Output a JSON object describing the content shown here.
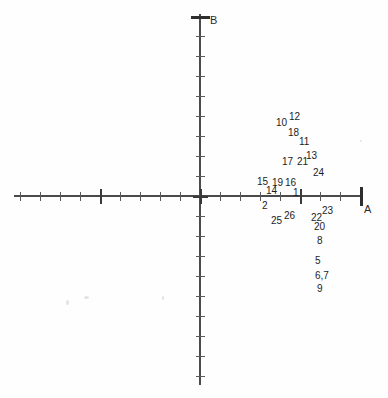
{
  "chart_data": {
    "type": "scatter",
    "title": "",
    "subtitle": "",
    "xlabel": "A",
    "ylabel": "B",
    "grid": false,
    "legend": null,
    "axes": {
      "origin_px": [
        200,
        196
      ],
      "x_axis_px": [
        14,
        360
      ],
      "y_axis_px": [
        14,
        384
      ],
      "x_tick_spacing_px": 20,
      "y_tick_spacing_px": 20,
      "major_tick_every": 5,
      "x_major_positions_px": [
        14,
        100,
        200,
        300,
        360
      ],
      "y_major_positions_px": [
        14,
        110,
        196,
        288,
        384
      ]
    },
    "note": "Unscaled biplot / ordination axes labelled A (horizontal) and B (vertical); only numeric specimen labels are printed, no plotted markers.",
    "points": [
      {
        "label": "12",
        "x": 289,
        "y": 112
      },
      {
        "label": "10",
        "x": 276,
        "y": 118
      },
      {
        "label": "18",
        "x": 288,
        "y": 128
      },
      {
        "label": "11",
        "x": 299,
        "y": 137
      },
      {
        "label": "13",
        "x": 306,
        "y": 151
      },
      {
        "label": "17",
        "x": 282,
        "y": 157
      },
      {
        "label": "21",
        "x": 297,
        "y": 157
      },
      {
        "label": "24",
        "x": 313,
        "y": 168
      },
      {
        "label": "15",
        "x": 257,
        "y": 177
      },
      {
        "label": "19",
        "x": 272,
        "y": 178
      },
      {
        "label": "16",
        "x": 285,
        "y": 178
      },
      {
        "label": "14",
        "x": 266,
        "y": 186
      },
      {
        "label": "1",
        "x": 293,
        "y": 188
      },
      {
        "label": "2",
        "x": 262,
        "y": 201
      },
      {
        "label": "23",
        "x": 322,
        "y": 206
      },
      {
        "label": "26",
        "x": 284,
        "y": 211
      },
      {
        "label": "22",
        "x": 311,
        "y": 213
      },
      {
        "label": "25",
        "x": 271,
        "y": 216
      },
      {
        "label": "20",
        "x": 314,
        "y": 222
      },
      {
        "label": "8",
        "x": 317,
        "y": 236
      },
      {
        "label": "5",
        "x": 315,
        "y": 256
      },
      {
        "label": "6,7",
        "x": 315,
        "y": 271
      },
      {
        "label": "9",
        "x": 317,
        "y": 284
      }
    ]
  },
  "axis_labels": {
    "horizontal": "A",
    "vertical": "B"
  },
  "colors": {
    "background": "#fefefe",
    "axis": "#4a4a4a",
    "tick": "#5a5a5a",
    "tick_major": "#3a3a3a",
    "text": "#1d1d1d"
  }
}
